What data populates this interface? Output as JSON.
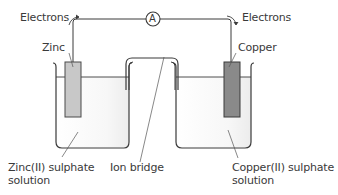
{
  "diagram": {
    "type": "electrochemical cell",
    "labels": {
      "electrons_left": "Electrons",
      "electrons_right": "Electrons",
      "ammeter": "A",
      "zinc": "Zinc",
      "copper": "Copper",
      "zinc_solution_line1": "Zinc(II) sulphate",
      "zinc_solution_line2": "solution",
      "ion_bridge": "Ion bridge",
      "copper_solution_line1": "Copper(II) sulphate",
      "copper_solution_line2": "solution"
    },
    "colors": {
      "line": "#3a3a3a",
      "zinc_electrode": "#c8c8c8",
      "copper_electrode": "#8a8a8a",
      "solution": "#f4f4f4"
    }
  }
}
